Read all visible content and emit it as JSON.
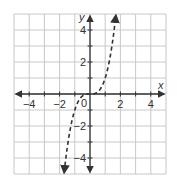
{
  "chart_data": {
    "type": "line",
    "title": "",
    "xlabel": "x",
    "ylabel": "y",
    "xlim": [
      -5,
      5
    ],
    "ylim": [
      -5,
      5
    ],
    "grid": true,
    "x_ticks": [
      -4,
      -2,
      0,
      2,
      4
    ],
    "y_ticks": [
      -4,
      -2,
      2,
      4
    ],
    "x_tick_labels": [
      "−4",
      "−2",
      "0",
      "2",
      "4"
    ],
    "y_tick_labels": [
      "−4",
      "−2",
      "2",
      "4"
    ],
    "origin_label": "0",
    "series": [
      {
        "name": "y = x^3",
        "style": "dashed",
        "arrows": "both",
        "x": [
          -1.7,
          -1.5,
          -1.25,
          -1.0,
          -0.75,
          -0.5,
          -0.25,
          0,
          0.25,
          0.5,
          0.75,
          1.0,
          1.25,
          1.5,
          1.7
        ],
        "y": [
          -4.91,
          -3.38,
          -1.95,
          -1.0,
          -0.42,
          -0.13,
          -0.02,
          0,
          0.02,
          0.13,
          0.42,
          1.0,
          1.95,
          3.38,
          4.91
        ]
      }
    ]
  },
  "colors": {
    "grid": "#c8c8c8",
    "axis": "#333333",
    "curve": "#333333"
  }
}
